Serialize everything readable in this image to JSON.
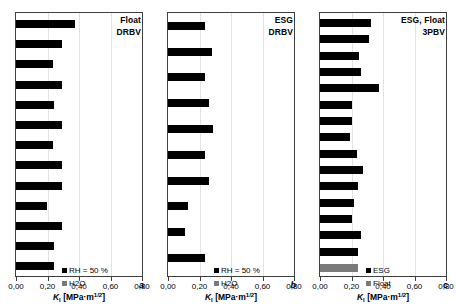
{
  "figure": {
    "axis_title_symbol": "K",
    "axis_title_subscript": "I",
    "axis_title_unit": "[MPa·m",
    "axis_title_exponent": "1/2",
    "axis_title_unit_close": "]"
  },
  "chart_data": [
    {
      "type": "bar",
      "orientation": "horizontal",
      "panel_letter": "a",
      "title": "Float DRBV",
      "title_lines": [
        "Float",
        "DRBV"
      ],
      "xlabel": "K_I [MPa·m^1/2]",
      "ylabel": "",
      "xlim": [
        0.0,
        0.8
      ],
      "xticks": [
        0.0,
        0.2,
        0.4,
        0.6,
        0.8
      ],
      "xticklabels": [
        "0,00",
        "0,20",
        "0,40",
        "0,60",
        "0,80"
      ],
      "grid": true,
      "legend_position": "bottom-right",
      "series": [
        {
          "name": "RH = 50 %",
          "color": "#000000",
          "values": [
            0.375,
            0.29,
            0.235,
            0.29,
            0.24,
            0.29,
            0.235,
            0.29,
            0.29,
            0.195,
            0.29,
            0.24,
            0.24,
            0.195
          ]
        },
        {
          "name": "H2O",
          "color": "#7a7a7a",
          "values": [
            0.145,
            0.19
          ]
        }
      ],
      "bar_order": [
        {
          "series": "RH = 50 %",
          "value": 0.375
        },
        {
          "series": "RH = 50 %",
          "value": 0.29
        },
        {
          "series": "RH = 50 %",
          "value": 0.235
        },
        {
          "series": "RH = 50 %",
          "value": 0.29
        },
        {
          "series": "RH = 50 %",
          "value": 0.24
        },
        {
          "series": "RH = 50 %",
          "value": 0.29
        },
        {
          "series": "RH = 50 %",
          "value": 0.235
        },
        {
          "series": "RH = 50 %",
          "value": 0.29
        },
        {
          "series": "RH = 50 %",
          "value": 0.29
        },
        {
          "series": "RH = 50 %",
          "value": 0.195
        },
        {
          "series": "RH = 50 %",
          "value": 0.29
        },
        {
          "series": "RH = 50 %",
          "value": 0.24
        },
        {
          "series": "RH = 50 %",
          "value": 0.24
        },
        {
          "series": "RH = 50 %",
          "value": 0.195
        },
        {
          "series": "H2O",
          "value": 0.145
        },
        {
          "series": "H2O",
          "value": 0.19
        }
      ]
    },
    {
      "type": "bar",
      "orientation": "horizontal",
      "panel_letter": "b",
      "title": "ESG DRBV",
      "title_lines": [
        "ESG",
        "DRBV"
      ],
      "xlabel": "K_I [MPa·m^1/2]",
      "ylabel": "",
      "xlim": [
        0.0,
        0.8
      ],
      "xticks": [
        0.0,
        0.2,
        0.4,
        0.6,
        0.8
      ],
      "xticklabels": [
        "0,00",
        "0,20",
        "0,40",
        "0,60",
        "0,80"
      ],
      "grid": true,
      "legend_position": "bottom-right",
      "series": [
        {
          "name": "RH = 50 %",
          "color": "#000000",
          "values": [
            0.235,
            0.28,
            0.235,
            0.26,
            0.285,
            0.235,
            0.26,
            0.125,
            0.105,
            0.235,
            0.28
          ]
        },
        {
          "name": "H2O",
          "color": "#7a7a7a",
          "values": [
            0.25,
            0.175
          ]
        }
      ],
      "bar_order": [
        {
          "series": "RH = 50 %",
          "value": 0.235
        },
        {
          "series": "RH = 50 %",
          "value": 0.28
        },
        {
          "series": "RH = 50 %",
          "value": 0.235
        },
        {
          "series": "RH = 50 %",
          "value": 0.26
        },
        {
          "series": "RH = 50 %",
          "value": 0.285
        },
        {
          "series": "RH = 50 %",
          "value": 0.235
        },
        {
          "series": "RH = 50 %",
          "value": 0.26
        },
        {
          "series": "RH = 50 %",
          "value": 0.125
        },
        {
          "series": "RH = 50 %",
          "value": 0.105
        },
        {
          "series": "RH = 50 %",
          "value": 0.235
        },
        {
          "series": "RH = 50 %",
          "value": 0.28
        },
        {
          "series": "H2O",
          "value": 0.25
        },
        {
          "series": "H2O",
          "value": 0.175
        }
      ]
    },
    {
      "type": "bar",
      "orientation": "horizontal",
      "panel_letter": "c",
      "title": "ESG, Float 3PBV",
      "title_lines": [
        "ESG, Float",
        "3PBV"
      ],
      "xlabel": "K_I [MPa·m^1/2]",
      "ylabel": "",
      "xlim": [
        0.0,
        0.8
      ],
      "xticks": [
        0.0,
        0.2,
        0.4,
        0.6,
        0.8
      ],
      "xticklabels": [
        "0,00",
        "0,20",
        "0,40",
        "0,60",
        "0,80"
      ],
      "grid": true,
      "legend_position": "bottom-right",
      "series": [
        {
          "name": "ESG",
          "color": "#000000",
          "values": [
            0.325,
            0.31,
            0.245,
            0.26,
            0.375,
            0.205,
            0.2,
            0.19,
            0.235,
            0.275,
            0.24,
            0.215,
            0.205,
            0.26,
            0.24
          ]
        },
        {
          "name": "Float",
          "color": "#7a7a7a",
          "values": [
            0.24,
            0.285,
            0.155,
            0.135
          ]
        }
      ],
      "bar_order": [
        {
          "series": "ESG",
          "value": 0.325
        },
        {
          "series": "ESG",
          "value": 0.31
        },
        {
          "series": "ESG",
          "value": 0.245
        },
        {
          "series": "ESG",
          "value": 0.26
        },
        {
          "series": "ESG",
          "value": 0.375
        },
        {
          "series": "ESG",
          "value": 0.205
        },
        {
          "series": "ESG",
          "value": 0.2
        },
        {
          "series": "ESG",
          "value": 0.19
        },
        {
          "series": "ESG",
          "value": 0.235
        },
        {
          "series": "ESG",
          "value": 0.275
        },
        {
          "series": "ESG",
          "value": 0.24
        },
        {
          "series": "ESG",
          "value": 0.215
        },
        {
          "series": "ESG",
          "value": 0.205
        },
        {
          "series": "ESG",
          "value": 0.26
        },
        {
          "series": "ESG",
          "value": 0.24
        },
        {
          "series": "Float",
          "value": 0.24
        },
        {
          "series": "Float",
          "value": 0.285
        },
        {
          "series": "Float",
          "value": 0.155
        },
        {
          "series": "Float",
          "value": 0.135
        }
      ]
    }
  ]
}
